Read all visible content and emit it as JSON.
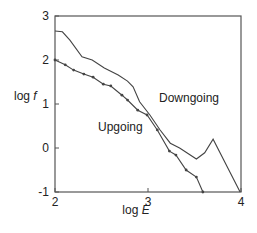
{
  "chart_data": {
    "type": "line",
    "title": "",
    "xlabel": "log E",
    "ylabel": "log f",
    "xlim": [
      2,
      4
    ],
    "ylim": [
      -1,
      3
    ],
    "xticks": [
      2,
      3,
      4
    ],
    "yticks": [
      -1,
      0,
      1,
      2,
      3
    ],
    "grid": false,
    "legend": "none (inline annotations)",
    "series": [
      {
        "name": "Downgoing",
        "markers": false,
        "x": [
          2.0,
          2.08,
          2.16,
          2.29,
          2.4,
          2.53,
          2.68,
          2.78,
          2.84,
          2.91,
          3.02,
          3.13,
          3.24,
          3.34,
          3.52,
          3.61,
          3.7,
          3.99
        ],
        "y": [
          2.66,
          2.64,
          2.45,
          2.07,
          2.0,
          1.82,
          1.66,
          1.52,
          1.39,
          1.05,
          0.75,
          0.41,
          0.11,
          0.0,
          -0.25,
          -0.11,
          0.2,
          -1.0
        ]
      },
      {
        "name": "Upgoing",
        "markers": true,
        "x": [
          2.0,
          2.11,
          2.2,
          2.31,
          2.41,
          2.52,
          2.6,
          2.72,
          2.78,
          2.89,
          2.99,
          3.1,
          3.23,
          3.3,
          3.41,
          3.52,
          3.59
        ],
        "y": [
          2.0,
          1.89,
          1.77,
          1.68,
          1.61,
          1.45,
          1.41,
          1.2,
          1.09,
          0.86,
          0.75,
          0.41,
          -0.07,
          -0.16,
          -0.5,
          -0.66,
          -1.0
        ]
      }
    ],
    "annotations": [
      {
        "text": "Downgoing",
        "x": 3.12,
        "y": 1.7
      },
      {
        "text": "Upgoing",
        "x": 2.46,
        "y": 1.05
      }
    ]
  },
  "labels": {
    "xlabel_prefix": "log ",
    "xlabel_var": "E",
    "ylabel_prefix": "log ",
    "ylabel_var": "f",
    "downgoing": "Downgoing",
    "upgoing": "Upgoing"
  },
  "colors": {
    "line": "#444444",
    "frame": "#555555",
    "text": "#222222"
  }
}
